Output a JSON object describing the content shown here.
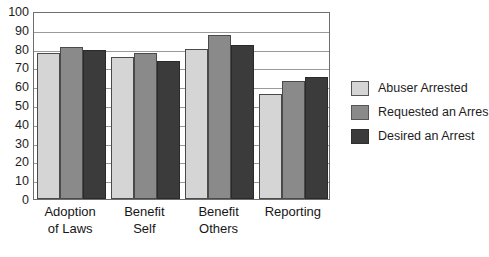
{
  "chart_data": {
    "type": "bar",
    "title": "",
    "xlabel": "",
    "ylabel": "",
    "ylim": [
      0,
      100
    ],
    "ytick_step": 10,
    "yticks": [
      100,
      90,
      80,
      70,
      60,
      50,
      40,
      30,
      20,
      10,
      0
    ],
    "grid": true,
    "legend_position": "right",
    "categories": [
      "Adoption of Laws",
      "Benefit Self",
      "Benefit Others",
      "Reporting"
    ],
    "category_lines": [
      [
        "Adoption",
        "of Laws"
      ],
      [
        "Benefit",
        "Self"
      ],
      [
        "Benefit",
        "Others"
      ],
      [
        "Reporting",
        ""
      ]
    ],
    "series": [
      {
        "name": "Abuser Arrested",
        "color": "#d5d5d5",
        "values": [
          77.5,
          75.5,
          80,
          56
        ]
      },
      {
        "name": "Requested an Arres",
        "color": "#8a8a8a",
        "values": [
          81,
          77.5,
          87,
          63
        ]
      },
      {
        "name": "Desired an Arrest",
        "color": "#3b3b3b",
        "values": [
          79,
          73.5,
          82,
          65
        ]
      }
    ]
  },
  "legend": {
    "items": [
      {
        "label": "Abuser Arrested"
      },
      {
        "label": "Requested an Arres"
      },
      {
        "label": "Desired an Arrest"
      }
    ]
  }
}
